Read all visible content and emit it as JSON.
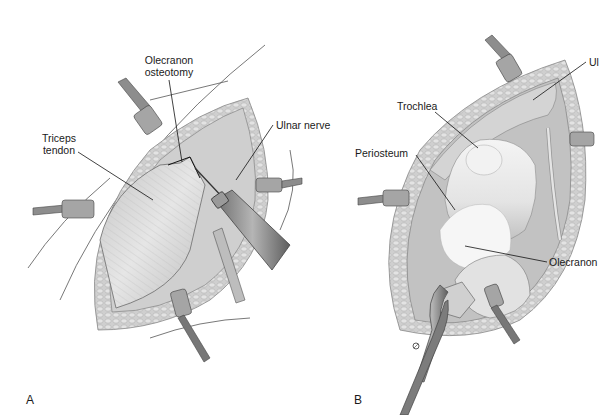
{
  "figure": {
    "panels": [
      {
        "id": "A",
        "letter": "A",
        "labels": {
          "olecranon_osteotomy_line1": "Olecranon",
          "olecranon_osteotomy_line2": "osteotomy",
          "triceps_tendon_line1": "Triceps",
          "triceps_tendon_line2": "tendon",
          "ulnar_nerve": "Ulnar nerve"
        }
      },
      {
        "id": "B",
        "letter": "B",
        "labels": {
          "trochlea": "Trochlea",
          "periosteum": "Periosteum",
          "olecranon": "Olecranon",
          "ulnar_nerve_cropped": "Ul"
        }
      }
    ],
    "colors": {
      "background": "#ffffff",
      "skin_fat": "#c9c9c9",
      "tendon": "#dcdcdc",
      "bone": "#eeeeee",
      "instrument": "#8a8a8a",
      "instrument_dark": "#555555",
      "leader_line": "#111111",
      "text": "#1a1a1a"
    }
  }
}
